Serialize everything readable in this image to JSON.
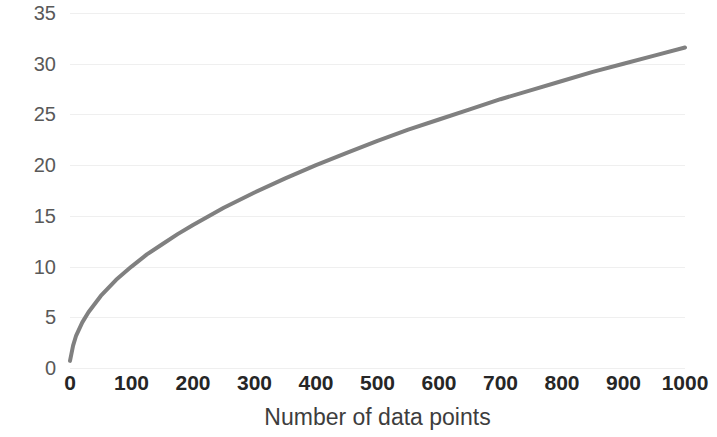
{
  "chart_data": {
    "type": "line",
    "title": "",
    "xlabel": "Number of data points",
    "ylabel": "Number of classes",
    "xlim": [
      0,
      1000
    ],
    "ylim": [
      0,
      35
    ],
    "x_ticks": [
      0,
      100,
      200,
      300,
      400,
      500,
      600,
      700,
      800,
      900,
      1000
    ],
    "x_tick_labels": [
      "0",
      "100",
      "200",
      "300",
      "400",
      "500",
      "600",
      "700",
      "800",
      "900",
      "1000"
    ],
    "y_ticks": [
      0,
      5,
      10,
      15,
      20,
      25,
      30,
      35
    ],
    "y_tick_labels": [
      "0",
      "5",
      "10",
      "15",
      "20",
      "25",
      "30",
      "35"
    ],
    "grid": {
      "horizontal": true,
      "vertical": false,
      "color": "#efefef"
    },
    "legend": {
      "visible": false,
      "position": "none"
    },
    "series": [
      {
        "name": "Number of classes",
        "color": "#808080",
        "line_width": 4,
        "relation": "y = sqrt(x)",
        "x": [
          0,
          5,
          10,
          20,
          30,
          50,
          75,
          100,
          125,
          150,
          175,
          200,
          250,
          300,
          350,
          400,
          450,
          500,
          550,
          600,
          650,
          700,
          750,
          800,
          850,
          900,
          950,
          1000
        ],
        "values": [
          0.7,
          2.2,
          3.2,
          4.5,
          5.5,
          7.1,
          8.7,
          10.0,
          11.2,
          12.2,
          13.2,
          14.1,
          15.8,
          17.3,
          18.7,
          20.0,
          21.2,
          22.4,
          23.5,
          24.5,
          25.5,
          26.5,
          27.4,
          28.3,
          29.2,
          30.0,
          30.8,
          31.6
        ]
      }
    ]
  },
  "colors": {
    "series": "#808080",
    "grid": "#efefef",
    "tick_text": "#262626",
    "y_tick_text": "#595959",
    "axis_title": "#3d3d3d",
    "background": "#ffffff"
  }
}
